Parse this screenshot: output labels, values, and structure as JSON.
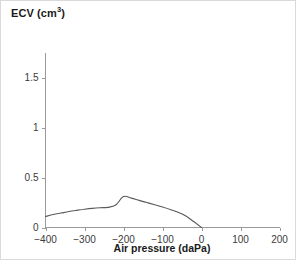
{
  "figure": {
    "title_main": "ECV (cm",
    "title_sup": "3",
    "title_close": ")",
    "border_color": "#d9d9d9",
    "background": "#ffffff"
  },
  "chart_data": {
    "type": "line",
    "title": "ECV (cm3)",
    "xlabel": "Air pressure (daPa)",
    "ylabel": "ECV (cm3)",
    "xlim": [
      -400,
      200
    ],
    "ylim": [
      0,
      1.75
    ],
    "xticks": [
      -400,
      -300,
      -200,
      -100,
      0,
      100,
      200
    ],
    "xtick_labels": [
      "−400",
      "−300",
      "−200",
      "−100",
      "0",
      "100",
      "200"
    ],
    "yticks": [
      0,
      0.5,
      1,
      1.5
    ],
    "ytick_labels": [
      "0",
      "0.5",
      "1",
      "1.5"
    ],
    "grid": false,
    "legend": null,
    "series": [
      {
        "name": "ECV",
        "color": "#5a5a5a",
        "x": [
          -400,
          -380,
          -360,
          -340,
          -320,
          -300,
          -280,
          -260,
          -240,
          -220,
          -200,
          -180,
          -160,
          -140,
          -120,
          -100,
          -80,
          -60,
          -40,
          -20,
          -10,
          0
        ],
        "values": [
          0.11,
          0.13,
          0.145,
          0.16,
          0.172,
          0.183,
          0.192,
          0.198,
          0.202,
          0.225,
          0.31,
          0.295,
          0.272,
          0.25,
          0.228,
          0.205,
          0.18,
          0.152,
          0.115,
          0.06,
          0.03,
          0.0
        ]
      }
    ]
  },
  "axis_titles": {
    "x": "Air pressure (daPa)"
  }
}
